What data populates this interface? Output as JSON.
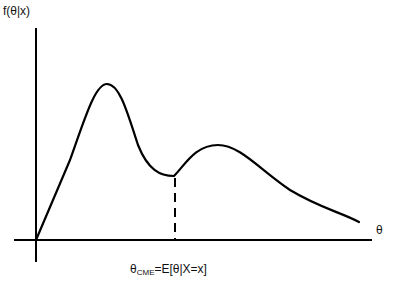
{
  "diagram": {
    "y_axis_label": "f(θ|x)",
    "x_axis_label": "θ",
    "estimator_label": {
      "prefix": "θ",
      "subscript": "CME",
      "suffix": "=E[θ|X=x]"
    },
    "curve": "bimodal posterior density with dashed line marking conditional mean",
    "colors": {
      "stroke": "#000000",
      "background": "#ffffff"
    }
  }
}
